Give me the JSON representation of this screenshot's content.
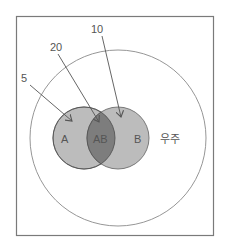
{
  "diagram": {
    "type": "venn",
    "sets": [
      {
        "id": "A",
        "label": "A"
      },
      {
        "id": "B",
        "label": "B"
      },
      {
        "id": "AB",
        "label": "AB"
      }
    ],
    "universe_label": "우주",
    "annotations": [
      {
        "label": "5",
        "points_to": "A"
      },
      {
        "label": "20",
        "points_to": "AB"
      },
      {
        "label": "10",
        "points_to": "B"
      }
    ],
    "colors": {
      "set_fill": "#b8b8b8",
      "intersection_fill": "#7d7d7d",
      "stroke": "#6e6e6e",
      "frame": "#7a7a7a"
    }
  }
}
